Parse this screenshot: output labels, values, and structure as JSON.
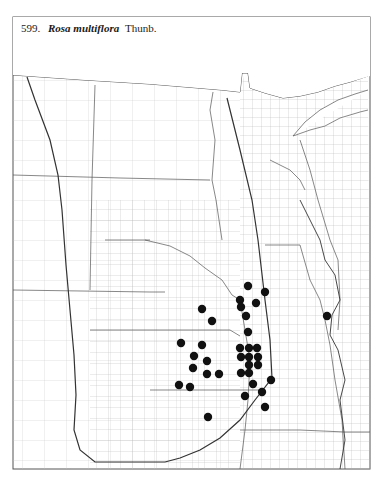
{
  "caption": {
    "number": "599.",
    "species": "Rosa multiflora",
    "authority": "Thunb."
  },
  "map": {
    "frame": {
      "x": 13,
      "y": 17,
      "w": 357,
      "h": 452
    },
    "line_color": "#7a7a7a",
    "bold_line_color": "#333333",
    "dot_color": "#111111",
    "dot_radius": 4.2
  },
  "occurrences": [
    [
      248,
      286
    ],
    [
      265,
      292
    ],
    [
      240,
      300
    ],
    [
      256,
      303
    ],
    [
      241,
      307
    ],
    [
      246,
      316
    ],
    [
      248,
      332
    ],
    [
      240,
      348
    ],
    [
      249,
      348
    ],
    [
      257,
      348
    ],
    [
      241,
      357
    ],
    [
      249,
      357
    ],
    [
      258,
      357
    ],
    [
      249,
      365
    ],
    [
      258,
      365
    ],
    [
      241,
      373
    ],
    [
      249,
      373
    ],
    [
      271,
      380
    ],
    [
      253,
      384
    ],
    [
      262,
      392
    ],
    [
      245,
      396
    ],
    [
      265,
      407
    ],
    [
      202,
      309
    ],
    [
      212,
      321
    ],
    [
      181,
      343
    ],
    [
      202,
      345
    ],
    [
      194,
      356
    ],
    [
      207,
      361
    ],
    [
      193,
      368
    ],
    [
      207,
      374
    ],
    [
      219,
      374
    ],
    [
      179,
      385
    ],
    [
      190,
      387
    ],
    [
      208,
      417
    ],
    [
      327,
      316
    ]
  ]
}
